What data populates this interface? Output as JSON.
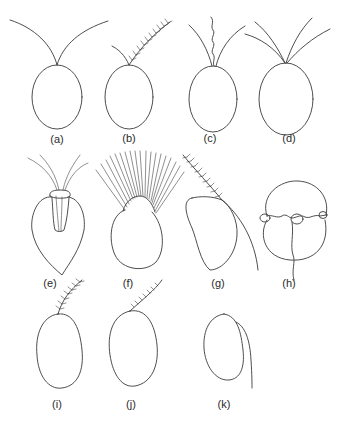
{
  "figure": {
    "panels": [
      {
        "id": "a",
        "label": "(a)",
        "description": "oval cell with two smooth flagella"
      },
      {
        "id": "b",
        "label": "(b)",
        "description": "oval cell with one smooth and one hairy (tinsel) flagellum"
      },
      {
        "id": "c",
        "label": "(c)",
        "description": "oval cell with two smooth flagella and a central wavy haptonema"
      },
      {
        "id": "d",
        "label": "(d)",
        "description": "oval cell with four smooth flagella"
      },
      {
        "id": "e",
        "label": "(e)",
        "description": "pear-shaped cell with flagella emerging from an apical pit"
      },
      {
        "id": "f",
        "label": "(f)",
        "description": "rounded cell with a crown of many flagella"
      },
      {
        "id": "g",
        "label": "(g)",
        "description": "kidney-shaped cell with hairy anterior flagellum and smooth trailing flagellum"
      },
      {
        "id": "h",
        "label": "(h)",
        "description": "dinoflagellate-like cell with transverse groove and trailing flagellum"
      },
      {
        "id": "i",
        "label": "(i)",
        "description": "oval cell with a single hairy flagellum"
      },
      {
        "id": "j",
        "label": "(j)",
        "description": "oval cell with a single laterally inserted hairy flagellum"
      },
      {
        "id": "k",
        "label": "(k)",
        "description": "oval cell with a single smooth trailing flagellum"
      }
    ],
    "line_color": "#3a3a3a",
    "background": "#ffffff"
  }
}
